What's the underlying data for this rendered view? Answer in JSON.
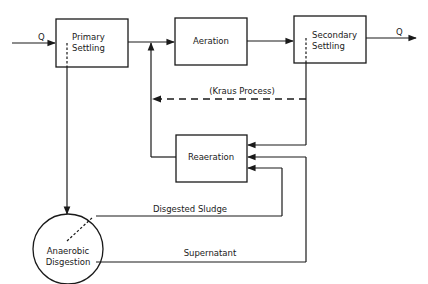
{
  "diagram": {
    "nodes": {
      "primary_settling": {
        "line1": "Primary",
        "line2": "Settling"
      },
      "aeration": {
        "label": "Aeration"
      },
      "secondary_settling": {
        "line1": "Secondary",
        "line2": "Settling"
      },
      "reaeration": {
        "label": "Reaeration"
      },
      "anaerobic_digestion": {
        "line1": "Anaerobic",
        "line2": "Disgestion"
      }
    },
    "edges": {
      "influent": "Q",
      "effluent": "Q",
      "kraus": "(Kraus Process)",
      "digested_sludge": "Disgested Sludge",
      "supernatant": "Supernatant"
    }
  }
}
